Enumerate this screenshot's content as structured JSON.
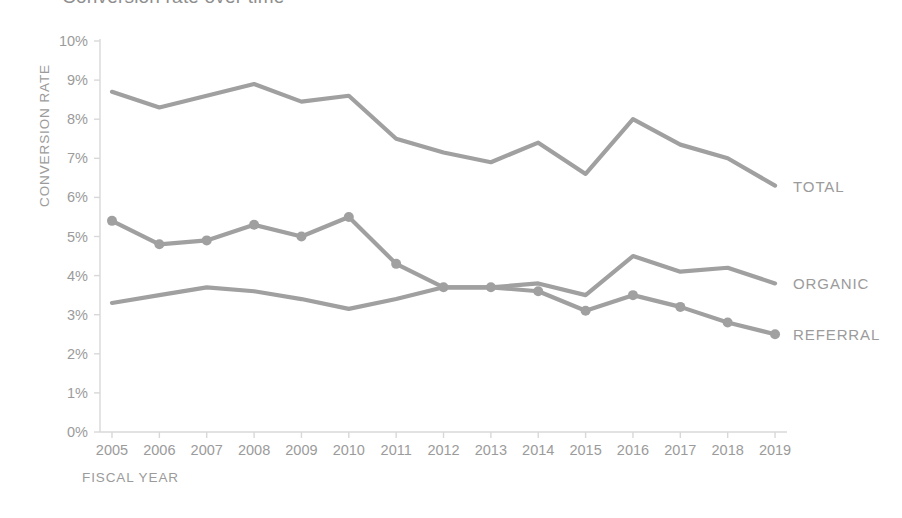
{
  "chart_data": {
    "type": "line",
    "title": "Conversion rate over time",
    "xlabel": "FISCAL YEAR",
    "ylabel": "CONVERSION RATE",
    "categories": [
      "2005",
      "2006",
      "2007",
      "2008",
      "2009",
      "2010",
      "2011",
      "2012",
      "2013",
      "2014",
      "2015",
      "2016",
      "2017",
      "2018",
      "2019"
    ],
    "ytick_labels": [
      "10%",
      "9%",
      "8%",
      "7%",
      "6%",
      "5%",
      "4%",
      "3%",
      "2%",
      "1%",
      "0%"
    ],
    "ytick_values": [
      10,
      9,
      8,
      7,
      6,
      5,
      4,
      3,
      2,
      1,
      0
    ],
    "ylim": [
      0,
      10
    ],
    "grid": false,
    "legend_position": "right-inline",
    "series": [
      {
        "name": "TOTAL",
        "markers": false,
        "color": "#a0a0a0",
        "values": [
          8.7,
          8.3,
          8.6,
          8.9,
          8.45,
          8.6,
          7.5,
          7.15,
          6.9,
          7.4,
          6.6,
          8.0,
          7.35,
          7.0,
          6.3
        ]
      },
      {
        "name": "ORGANIC",
        "markers": false,
        "color": "#a0a0a0",
        "values": [
          3.3,
          3.5,
          3.7,
          3.6,
          3.4,
          3.15,
          3.4,
          3.7,
          3.7,
          3.8,
          3.5,
          4.5,
          4.1,
          4.2,
          3.8
        ]
      },
      {
        "name": "REFERRAL",
        "markers": true,
        "color": "#a0a0a0",
        "values": [
          5.4,
          4.8,
          4.9,
          5.3,
          5.0,
          5.5,
          4.3,
          3.7,
          3.7,
          3.6,
          3.1,
          3.5,
          3.2,
          2.8,
          2.5
        ]
      }
    ]
  },
  "axis": {
    "line_color": "#d8d8d8",
    "tick_color": "#d8d8d8"
  }
}
